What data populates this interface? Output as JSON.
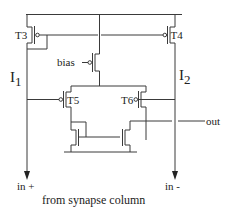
{
  "diagram": {
    "type": "circuit-schematic",
    "transistors": [
      {
        "id": "T3",
        "label": "T3",
        "kind": "pmos"
      },
      {
        "id": "T4",
        "label": "T4",
        "kind": "pmos"
      },
      {
        "id": "T5",
        "label": "T5",
        "kind": "pmos"
      },
      {
        "id": "T6",
        "label": "T6",
        "kind": "pmos"
      },
      {
        "id": "bias",
        "label": "bias",
        "kind": "pmos"
      }
    ],
    "currents": {
      "left": {
        "symbol": "I",
        "subscript": "1"
      },
      "right": {
        "symbol": "I",
        "subscript": "2"
      }
    },
    "ports": {
      "bias": "bias",
      "out": "out",
      "in_plus": "in +",
      "in_minus": "in -"
    },
    "caption": "from synapse column",
    "colors": {
      "line": "#3a3a3a",
      "text": "#222222",
      "background": "#ffffff"
    }
  }
}
